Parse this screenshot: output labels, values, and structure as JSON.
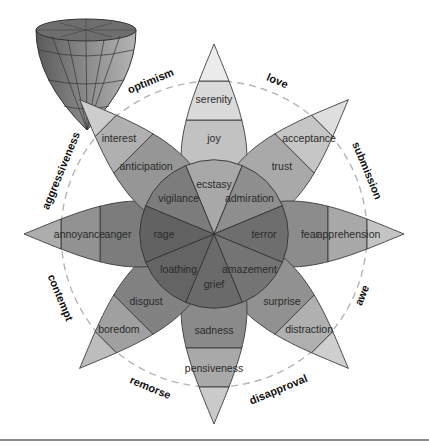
{
  "center": {
    "x": 214,
    "y": 234
  },
  "radii": {
    "inner": 74,
    "middle": 114,
    "outer": 153,
    "tip": 190
  },
  "petals": [
    {
      "angle": -90,
      "inner": "ecstasy",
      "middle": "joy",
      "outer": "serenity",
      "colors": [
        "#a8a8a8",
        "#c2c2c2",
        "#dadada",
        "#ececec"
      ]
    },
    {
      "angle": -45,
      "inner": "admiration",
      "middle": "trust",
      "outer": "acceptance",
      "colors": [
        "#8e8e8e",
        "#a9a9a9",
        "#c6c6c6",
        "#dedede"
      ]
    },
    {
      "angle": 0,
      "inner": "terror",
      "middle": "fear",
      "outer": "apprehension",
      "colors": [
        "#6e6e6e",
        "#8c8c8c",
        "#a8a8a8",
        "#c4c4c4"
      ]
    },
    {
      "angle": 45,
      "inner": "amazement",
      "middle": "surprise",
      "outer": "distraction",
      "colors": [
        "#747474",
        "#919191",
        "#b0b0b0",
        "#cfcfcf"
      ]
    },
    {
      "angle": 90,
      "inner": "grief",
      "middle": "sadness",
      "outer": "pensiveness",
      "colors": [
        "#6a6a6a",
        "#8a8a8a",
        "#a9a9a9",
        "#cacaca"
      ]
    },
    {
      "angle": 135,
      "inner": "loathing",
      "middle": "disgust",
      "outer": "boredom",
      "colors": [
        "#646464",
        "#828282",
        "#a0a0a0",
        "#bdbdbd"
      ]
    },
    {
      "angle": 180,
      "inner": "rage",
      "middle": "anger",
      "outer": "annoyance",
      "colors": [
        "#626262",
        "#7c7c7c",
        "#929292",
        "#adadad"
      ]
    },
    {
      "angle": -135,
      "inner": "vigilance",
      "middle": "anticipation",
      "outer": "interest",
      "colors": [
        "#7c7c7c",
        "#969696",
        "#b0b0b0",
        "#cdcdcd"
      ]
    }
  ],
  "dyads": [
    {
      "label": "love",
      "angle": -67.5,
      "r": 166
    },
    {
      "label": "submission",
      "angle": -22.5,
      "r": 166
    },
    {
      "label": "awe",
      "angle": 22.5,
      "r": 160
    },
    {
      "label": "disapproval",
      "angle": 67.5,
      "r": 168
    },
    {
      "label": "remorse",
      "angle": 112.5,
      "r": 166
    },
    {
      "label": "contempt",
      "angle": 157.5,
      "r": 166
    },
    {
      "label": "aggressiveness",
      "angle": -157.5,
      "r": 166
    },
    {
      "label": "optimism",
      "angle": -112.5,
      "r": 166
    }
  ],
  "dashed_circle": {
    "r": 153,
    "color": "#b5b5b5"
  },
  "cone": {
    "label": "3D cone model",
    "x": 80,
    "y": 70
  }
}
